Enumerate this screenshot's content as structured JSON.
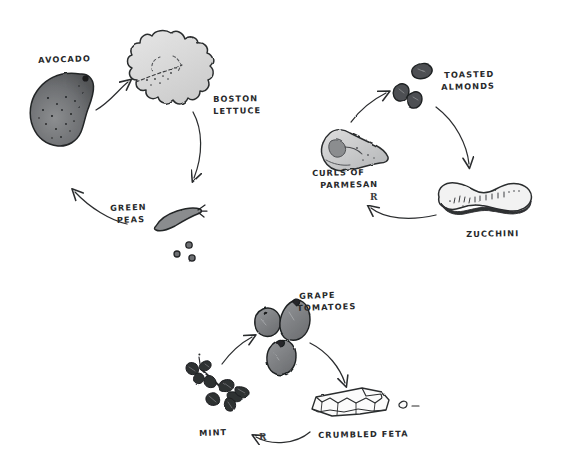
{
  "canvas": {
    "width": 564,
    "height": 469,
    "background": "#ffffff",
    "ink": "#2b2d2f",
    "style_note": "hand-drawn pen-and-ink sketch"
  },
  "diagram": {
    "type": "hand-drawn-illustration",
    "groups": [
      {
        "name": "top-cycle",
        "items": [
          "avocado",
          "boston-lettuce",
          "green-peas"
        ]
      },
      {
        "name": "right-cycle",
        "items": [
          "curls-of-parmesan",
          "toasted-almonds",
          "zucchini"
        ]
      },
      {
        "name": "bottom-cycle",
        "items": [
          "mint",
          "grape-tomatoes",
          "crumbled-feta"
        ]
      }
    ]
  },
  "labels": {
    "avocado": "AVOCADO",
    "boston_lettuce_line1": "BOSTON",
    "boston_lettuce_line2": "LETTUCE",
    "green_peas_line1": "GREEN",
    "green_peas_line2": "PEAS",
    "toasted_almonds_line1": "TOASTED",
    "toasted_almonds_line2": "ALMONDS",
    "curls_of_parmesan_line1": "CURLS OF",
    "curls_of_parmesan_line2": "PARMESAN",
    "zucchini": "ZUCCHINI",
    "grape_tomatoes_line1": "GRAPE",
    "grape_tomatoes_line2": "TOMATOES",
    "mint": "MINT",
    "crumbled_feta": "CRUMBLED FETA",
    "arrow_mark_parmesan": "R",
    "arrow_mark_feta": "R"
  },
  "colors": {
    "ink": "#2b2d2f",
    "avocado_fill": "#6f7174",
    "lettuce_fill": "#dcdcdc",
    "peas_fill": "#8a8c8e",
    "parmesan_fill": "#cfcfcf",
    "parmesan_shadow": "#8f9193",
    "almond_fill": "#57595b",
    "zucchini_fill": "#f0f0f0",
    "zucchini_shadow": "#3a3c3e",
    "tomato_fill": "#7e8083",
    "mint_fill": "#2f3133",
    "feta_fill": "#fbfbfb",
    "paper": "#ffffff"
  }
}
